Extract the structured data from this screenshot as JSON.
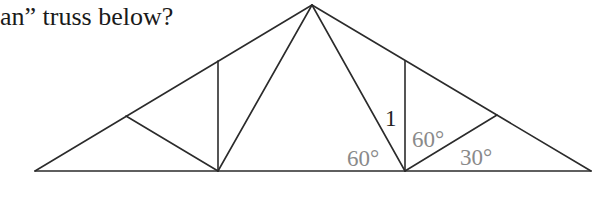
{
  "question": {
    "text": "an” truss below?"
  },
  "diagram": {
    "colors": {
      "line": "#2b2b2b",
      "label_dark": "#222222",
      "label_gray": "#8a8a8a"
    },
    "nodes": {
      "left_support": [
        35,
        171
      ],
      "left_panel_point": [
        126,
        116
      ],
      "left_vertical_top": [
        218,
        61
      ],
      "left_bottom_node": [
        218,
        171
      ],
      "apex": [
        312,
        5
      ],
      "right_vertical_top": [
        405,
        61
      ],
      "right_bottom_node": [
        405,
        171
      ],
      "right_panel_point": [
        497,
        115
      ],
      "right_support": [
        591,
        171
      ]
    },
    "labels": {
      "member_length": "1",
      "angle_left_diagonal": "60°",
      "angle_right_vertical": "60°",
      "angle_right_base": "30°"
    }
  }
}
